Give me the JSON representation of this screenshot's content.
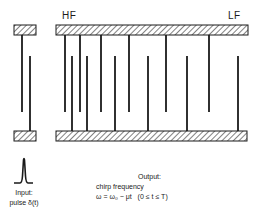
{
  "labels": {
    "high_freq": "HF",
    "low_freq": "LF",
    "input_title": "Input:",
    "input_signal": "pulse δ(t)",
    "output_title": "Output:",
    "output_desc": "chirp frequency",
    "output_formula": "ω = ω₀ − μt   (0 ≤ t ≤ T)"
  },
  "colors": {
    "ink": "#1a1a1a",
    "background": "#ffffff"
  },
  "reference_transducer": {
    "top_bar": {
      "x": 14,
      "y": 25,
      "w": 22,
      "h": 10
    },
    "bottom_bar": {
      "x": 14,
      "y": 131,
      "w": 22,
      "h": 10
    },
    "top_fingers_x": [
      22
    ],
    "bottom_fingers_x": [
      30
    ]
  },
  "dispersive_transducer": {
    "top_bar": {
      "x": 56,
      "y": 25,
      "w": 192,
      "h": 10
    },
    "bottom_bar": {
      "x": 56,
      "y": 131,
      "w": 191,
      "h": 10
    },
    "top_fingers_x": [
      65,
      80,
      101,
      129,
      166,
      209
    ],
    "bottom_fingers_x": [
      72,
      87,
      115,
      148,
      187,
      238
    ],
    "top_finger_end_y": 112,
    "bottom_finger_start_y": 56
  }
}
